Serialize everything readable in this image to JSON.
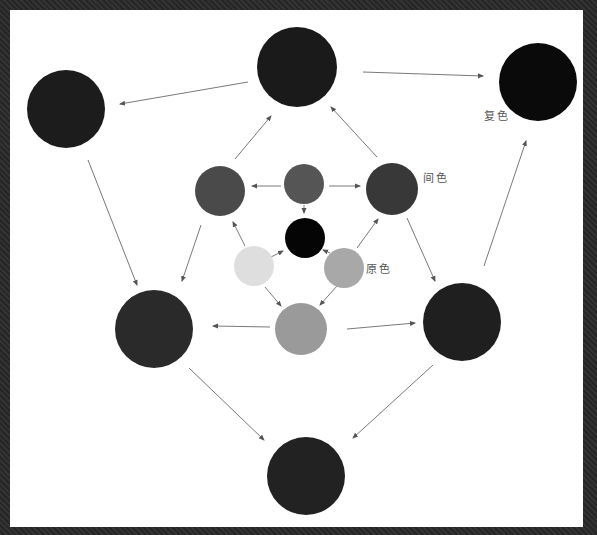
{
  "labels": {
    "compound": "复色",
    "secondary": "间色",
    "primary": "原色"
  },
  "circles": [
    {
      "id": "compound-top",
      "cx": 297,
      "cy": 67,
      "r": 40,
      "fill": "#1a1a1a",
      "group": "compound"
    },
    {
      "id": "compound-top-left",
      "cx": 66,
      "cy": 109,
      "r": 39,
      "fill": "#1c1c1c",
      "group": "compound"
    },
    {
      "id": "compound-top-right",
      "cx": 538,
      "cy": 82,
      "r": 39,
      "fill": "#0a0a0a",
      "group": "compound"
    },
    {
      "id": "compound-mid-left",
      "cx": 154,
      "cy": 329,
      "r": 39,
      "fill": "#2a2a2a",
      "group": "compound"
    },
    {
      "id": "compound-mid-right",
      "cx": 462,
      "cy": 322,
      "r": 39,
      "fill": "#1f1f1f",
      "group": "compound"
    },
    {
      "id": "compound-bottom",
      "cx": 306,
      "cy": 476,
      "r": 39,
      "fill": "#222222",
      "group": "compound"
    },
    {
      "id": "secondary-left",
      "cx": 220,
      "cy": 191,
      "r": 25,
      "fill": "#4a4a4a",
      "group": "secondary"
    },
    {
      "id": "secondary-top",
      "cx": 304,
      "cy": 184,
      "r": 20,
      "fill": "#555555",
      "group": "secondary"
    },
    {
      "id": "secondary-right",
      "cx": 392,
      "cy": 189,
      "r": 26,
      "fill": "#383838",
      "group": "secondary"
    },
    {
      "id": "primary-center",
      "cx": 305,
      "cy": 238,
      "r": 20,
      "fill": "#050505",
      "group": "primary"
    },
    {
      "id": "primary-left",
      "cx": 254,
      "cy": 266,
      "r": 20,
      "fill": "#dedede",
      "group": "primary"
    },
    {
      "id": "primary-right",
      "cx": 344,
      "cy": 268,
      "r": 20,
      "fill": "#a8a8a8",
      "group": "primary"
    },
    {
      "id": "secondary-bottom",
      "cx": 301,
      "cy": 329,
      "r": 26,
      "fill": "#9a9a9a",
      "group": "secondary"
    }
  ],
  "arrows": [
    {
      "from": [
        248,
        82
      ],
      "to": [
        120,
        104
      ]
    },
    {
      "from": [
        363,
        72
      ],
      "to": [
        483,
        76
      ]
    },
    {
      "from": [
        235,
        159
      ],
      "to": [
        271,
        116
      ]
    },
    {
      "from": [
        377,
        157
      ],
      "to": [
        331,
        107
      ]
    },
    {
      "from": [
        88,
        160
      ],
      "to": [
        137,
        285
      ]
    },
    {
      "from": [
        484,
        266
      ],
      "to": [
        526,
        141
      ]
    },
    {
      "from": [
        201,
        225
      ],
      "to": [
        182,
        281
      ]
    },
    {
      "from": [
        407,
        218
      ],
      "to": [
        435,
        281
      ]
    },
    {
      "from": [
        281,
        186
      ],
      "to": [
        252,
        186
      ]
    },
    {
      "from": [
        329,
        186
      ],
      "to": [
        360,
        186
      ]
    },
    {
      "from": [
        304,
        205
      ],
      "to": [
        304,
        213
      ]
    },
    {
      "from": [
        245,
        246
      ],
      "to": [
        233,
        222
      ]
    },
    {
      "from": [
        357,
        248
      ],
      "to": [
        378,
        219
      ]
    },
    {
      "from": [
        271,
        257
      ],
      "to": [
        283,
        251
      ]
    },
    {
      "from": [
        330,
        253
      ],
      "to": [
        323,
        250
      ]
    },
    {
      "from": [
        265,
        287
      ],
      "to": [
        281,
        306
      ]
    },
    {
      "from": [
        337,
        286
      ],
      "to": [
        320,
        305
      ]
    },
    {
      "from": [
        270,
        327
      ],
      "to": [
        213,
        326
      ]
    },
    {
      "from": [
        347,
        329
      ],
      "to": [
        415,
        323
      ]
    },
    {
      "from": [
        189,
        368
      ],
      "to": [
        264,
        440
      ]
    },
    {
      "from": [
        433,
        365
      ],
      "to": [
        353,
        438
      ]
    }
  ],
  "label_positions": {
    "compound": {
      "x": 484,
      "y": 115
    },
    "secondary": {
      "x": 423,
      "y": 177
    },
    "primary": {
      "x": 366,
      "y": 268
    }
  },
  "colors": {
    "background_frame": "#2e2e2e",
    "canvas": "#ffffff",
    "arrow": "#6a6a6a",
    "label": "#555555"
  }
}
